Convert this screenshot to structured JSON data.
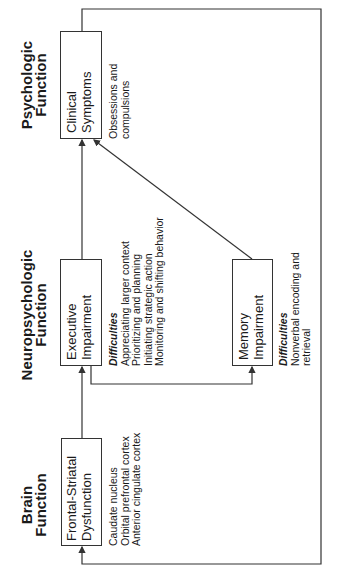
{
  "columns": {
    "psychologic": {
      "line1": "Psychologic",
      "line2": "Function"
    },
    "neuropsychologic": {
      "line1": "Neuropsychologic",
      "line2": "Function"
    },
    "brain": {
      "line1": "Brain",
      "line2": "Function"
    }
  },
  "boxes": {
    "clinical": {
      "line1": "Clinical",
      "line2": "Symptoms"
    },
    "executive": {
      "line1": "Executive",
      "line2": "Impairment"
    },
    "memory": {
      "line1": "Memory",
      "line2": "Impairment"
    },
    "frontal": {
      "line1": "Frontal-Striatal",
      "line2": "Dysfunction"
    }
  },
  "notes": {
    "clinical": [
      "Obsessions and",
      "compulsions"
    ],
    "executive": {
      "heading": "Difficulties",
      "items": [
        "Appreciating larger context",
        "Prioritizing and planning",
        "Initiating strategic action",
        "Monitoring and shifting behavior"
      ]
    },
    "memory": {
      "heading": "Difficulties",
      "items": [
        "Nonverbal encoding and",
        "retrieval"
      ]
    },
    "frontal": [
      "Caudate nucleus",
      "Orbital prefrontal cortex",
      "Anterior cingulate cortex"
    ]
  },
  "colors": {
    "line": "#333333",
    "text": "#1a1a1a",
    "background": "#ffffff"
  }
}
